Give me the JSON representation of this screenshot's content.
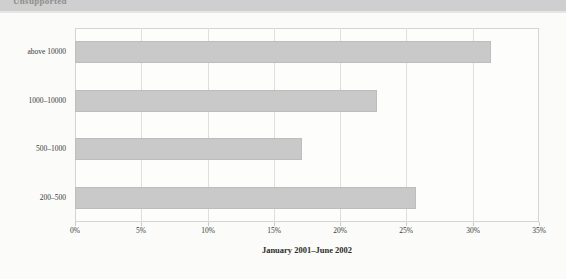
{
  "header": {
    "band_title": "Unsupported",
    "band_color": "#cfcfcf"
  },
  "chart_data": {
    "type": "bar",
    "orientation": "horizontal",
    "title": "",
    "subtitle": "",
    "xlabel": "January 2001–June 2002",
    "ylabel": "",
    "categories": [
      "above 10000",
      "1000–10000",
      "500–1000",
      "200–500"
    ],
    "values": [
      31.4,
      22.8,
      17.1,
      25.7
    ],
    "value_suffix": "%",
    "xlim": [
      0,
      35
    ],
    "xticks": [
      0,
      5,
      10,
      15,
      20,
      25,
      30,
      35
    ],
    "xtick_labels": [
      "0%",
      "5%",
      "10%",
      "15%",
      "20%",
      "25%",
      "30%",
      "35%"
    ],
    "grid": true,
    "grid_axis": "x",
    "legend": false,
    "legend_position": "none",
    "bar_color": "#c9c9c9",
    "bar_border_color": "#bdbdbd",
    "plot_background": "#fdfdfc",
    "grid_color": "#dedede"
  }
}
